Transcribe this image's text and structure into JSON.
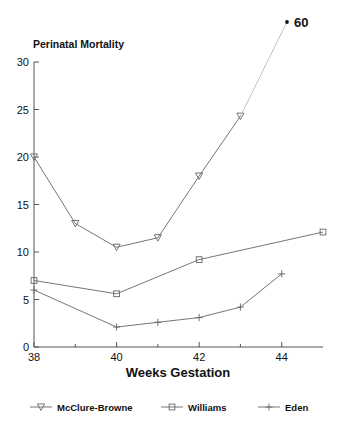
{
  "chart_data": {
    "type": "line",
    "title": "Perinatal Mortality",
    "xlabel": "Weeks Gestation",
    "ylabel": "",
    "xlim": [
      38,
      45
    ],
    "ylim": [
      0,
      30
    ],
    "xticks": [
      38,
      40,
      42,
      44
    ],
    "xtick_labels": [
      "38",
      "40",
      "42",
      "44"
    ],
    "yticks": [
      0,
      5,
      10,
      15,
      20,
      25,
      30
    ],
    "ytick_labels": [
      "0",
      "5",
      "10",
      "15",
      "20",
      "25",
      "30"
    ],
    "grid": false,
    "legend_position": "bottom",
    "series": [
      {
        "name": "McClure-Browne",
        "marker": "triangle-down",
        "x": [
          38,
          39,
          40,
          41,
          42,
          43
        ],
        "values": [
          20,
          13,
          10.5,
          11.5,
          18,
          24.3
        ]
      },
      {
        "name": "Williams",
        "marker": "square",
        "x": [
          38,
          40,
          42,
          45
        ],
        "values": [
          7,
          5.6,
          9.2,
          12.1
        ]
      },
      {
        "name": "Eden",
        "marker": "plus",
        "x": [
          38,
          40,
          41,
          42,
          43,
          44
        ],
        "values": [
          6,
          2.1,
          2.6,
          3.1,
          4.2,
          7.7
        ]
      }
    ],
    "annotations": [
      {
        "label": "60",
        "marker": "dot",
        "series": "McClure-Browne",
        "x": 44,
        "value": 60,
        "note": "off-scale point; line drawn from 43 toward marker at top right"
      }
    ],
    "colors": {
      "line": "#666666",
      "tail": "#b9b9b9",
      "axis": "#555555",
      "text": "#111111",
      "background": "#ffffff"
    }
  },
  "legend": {
    "items": [
      {
        "label": "McClure-Browne",
        "marker": "triangle-down"
      },
      {
        "label": "Williams",
        "marker": "square"
      },
      {
        "label": "Eden",
        "marker": "plus"
      }
    ]
  }
}
